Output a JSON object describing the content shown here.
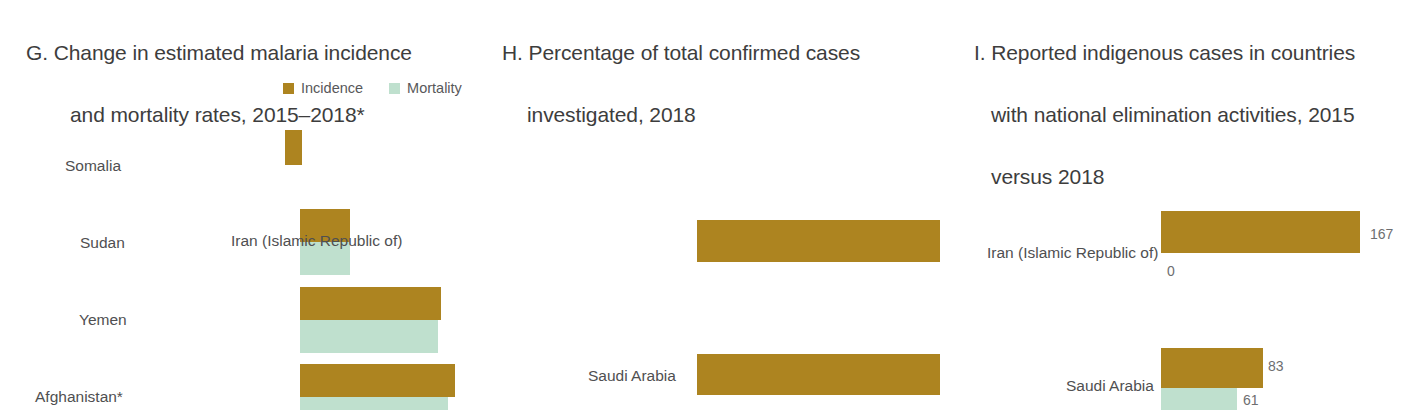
{
  "colors": {
    "gold": "#ad8420",
    "mint": "#bfe0ce",
    "text": "#4a4a4a"
  },
  "panels": {
    "g": {
      "title_line1": "G. Change in estimated malaria incidence",
      "title_line2": "and mortality rates, 2015–2018*",
      "legend": [
        {
          "label": "Incidence",
          "color": "#ad8420"
        },
        {
          "label": "Mortality",
          "color": "#bfe0ce"
        }
      ]
    },
    "h": {
      "title_line1": "H. Percentage of total confirmed cases",
      "title_line2": "investigated, 2018"
    },
    "i": {
      "title_line1": "I. Reported indigenous cases in countries",
      "title_line2": "with national elimination activities, 2015",
      "title_line3": "versus 2018",
      "legend": [
        {
          "label": "2015",
          "color": "#ad8420"
        },
        {
          "label": "2018",
          "color": "#bfe0ce"
        }
      ]
    }
  },
  "chart_data": [
    {
      "id": "G",
      "type": "bar",
      "title": "G. Change in estimated malaria incidence and mortality rates, 2015-2018*",
      "orientation": "horizontal",
      "categories": [
        "Somalia",
        "Sudan",
        "Yemen",
        "Afghanistan*"
      ],
      "series": [
        {
          "name": "Incidence",
          "color": "#ad8420",
          "values": [
            17,
            50,
            141,
            155
          ]
        },
        {
          "name": "Mortality",
          "color": "#bfe0ce",
          "values": [
            0,
            50,
            138,
            148
          ]
        }
      ],
      "note": "Bar lengths read in pixels from the plot; axis is unlabelled. Somalia shows an incidence bar only. The Afghanistan* mortality bar is cropped by the bottom edge of the image.",
      "legend_position": "top-right",
      "grid": false,
      "xlabel": "",
      "ylabel": ""
    },
    {
      "id": "H",
      "type": "bar",
      "title": "H. Percentage of total confirmed cases investigated, 2018",
      "orientation": "horizontal",
      "categories": [
        "Iran (Islamic Republic of)",
        "Saudi Arabia"
      ],
      "series": [
        {
          "name": "Percentage investigated",
          "color": "#ad8420",
          "values": [
            100,
            100
          ]
        }
      ],
      "note": "Both bars extend the full plot width, indicating 100% of confirmed cases investigated. No numeric data labels are printed.",
      "grid": false,
      "xlabel": "",
      "ylabel": ""
    },
    {
      "id": "I",
      "type": "bar",
      "title": "I. Reported indigenous cases in countries with national elimination activities, 2015 versus 2018",
      "orientation": "horizontal",
      "categories": [
        "Iran (Islamic Republic of)",
        "Saudi Arabia"
      ],
      "series": [
        {
          "name": "2015",
          "color": "#ad8420",
          "values": [
            167,
            83
          ]
        },
        {
          "name": "2018",
          "color": "#bfe0ce",
          "values": [
            0,
            61
          ]
        }
      ],
      "legend_position": "top-right",
      "note": "Value labels are printed at the end of each bar. The Iran 2018 value of 0 has no visible bar. The Saudi Arabia 2018 bar is cropped by the bottom edge of the image.",
      "grid": false,
      "xlabel": "",
      "ylabel": ""
    }
  ],
  "panel_g_rows": [
    {
      "label": "Somalia",
      "label_x": 65,
      "label_y": 157,
      "incidence": {
        "x": 285,
        "y": 130,
        "w": 17,
        "h": 35
      },
      "mortality": null
    },
    {
      "label": "Sudan",
      "label_x": 80,
      "label_y": 234,
      "incidence": {
        "x": 300,
        "y": 209,
        "w": 50,
        "h": 33
      },
      "mortality": {
        "x": 300,
        "y": 242,
        "w": 50,
        "h": 33
      }
    },
    {
      "label": "Yemen",
      "label_x": 79,
      "label_y": 311,
      "incidence": {
        "x": 300,
        "y": 287,
        "w": 141,
        "h": 33
      },
      "mortality": {
        "x": 300,
        "y": 320,
        "w": 138,
        "h": 33
      }
    },
    {
      "label": "Afghanistan*",
      "label_x": 35,
      "label_y": 388,
      "incidence": {
        "x": 300,
        "y": 364,
        "w": 155,
        "h": 33
      },
      "mortality": {
        "x": 300,
        "y": 397,
        "w": 148,
        "h": 13
      }
    }
  ],
  "panel_h_rows": [
    {
      "label": "Iran (Islamic Republic of)",
      "label_x": 231,
      "label_y": 232,
      "bar": {
        "x": 697,
        "y": 220,
        "w": 243,
        "h": 42
      }
    },
    {
      "label": "Saudi Arabia",
      "label_x": 588,
      "label_y": 367,
      "bar": {
        "x": 697,
        "y": 354,
        "w": 243,
        "h": 41
      }
    }
  ],
  "panel_i_rows": [
    {
      "label": "Iran (Islamic Republic of)",
      "label_x": 987,
      "label_y": 244,
      "bar2015": {
        "x": 1161,
        "y": 211,
        "w": 199,
        "h": 42
      },
      "value2015": "167",
      "value2015_x": 1370,
      "value2015_y": 226,
      "bar2018": null,
      "value2018": "0",
      "value2018_x": 1167,
      "value2018_y": 263
    },
    {
      "label": "Saudi Arabia",
      "label_x": 1066,
      "label_y": 377,
      "bar2015": {
        "x": 1161,
        "y": 348,
        "w": 102,
        "h": 40
      },
      "value2015": "83",
      "value2015_x": 1268,
      "value2015_y": 358,
      "bar2018": {
        "x": 1161,
        "y": 388,
        "w": 76,
        "h": 22
      },
      "value2018": "61",
      "value2018_x": 1243,
      "value2018_y": 392
    }
  ]
}
